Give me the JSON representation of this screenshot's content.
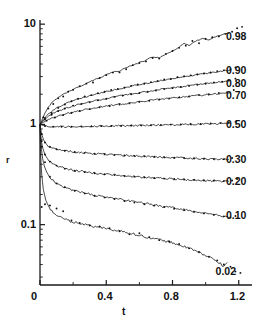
{
  "chart_data": {
    "type": "line",
    "title": "",
    "xlabel": "t",
    "ylabel": "r",
    "xscale": "linear",
    "yscale": "log",
    "xlim": [
      0,
      1.28
    ],
    "ylim": [
      0.025,
      11
    ],
    "xticks": [
      0,
      0.4,
      0.8,
      1.2
    ],
    "xtick_labels": [
      "0",
      "0.4",
      "0.8",
      "1.2"
    ],
    "xminorticks": [
      0.2,
      0.6,
      1.0
    ],
    "yticks": [
      0.1,
      1,
      10
    ],
    "ytick_labels": [
      "0.1",
      "1",
      "10"
    ],
    "grid": false,
    "legend": "inline-right-end-of-curve",
    "marker_style": "dots",
    "line_style": "solid-noisy",
    "series": [
      {
        "name": "0.98",
        "label": "0.98",
        "label_x": 1.215,
        "label_y": 7.6,
        "x": [
          0.0,
          0.01,
          0.02,
          0.03,
          0.05,
          0.07,
          0.09,
          0.11,
          0.13,
          0.15,
          0.18,
          0.21,
          0.24,
          0.27,
          0.3,
          0.33,
          0.36,
          0.39,
          0.42,
          0.45,
          0.48,
          0.51,
          0.54,
          0.57,
          0.6,
          0.63,
          0.66,
          0.69,
          0.72,
          0.75,
          0.78,
          0.81,
          0.84,
          0.87,
          0.9,
          0.93,
          0.96,
          0.99,
          1.02,
          1.05,
          1.08,
          1.11,
          1.14
        ],
        "y": [
          1.0,
          1.09,
          1.19,
          1.3,
          1.48,
          1.63,
          1.75,
          1.86,
          1.95,
          2.04,
          2.16,
          2.28,
          2.4,
          2.53,
          2.66,
          2.8,
          2.92,
          3.06,
          3.22,
          3.36,
          3.42,
          3.62,
          3.8,
          3.95,
          4.12,
          4.3,
          4.55,
          4.72,
          4.6,
          4.95,
          5.2,
          5.55,
          5.9,
          6.45,
          6.1,
          6.6,
          7.0,
          7.2,
          7.0,
          7.45,
          7.7,
          8.0,
          8.1
        ],
        "dots_x": [
          0.02,
          0.05,
          0.08,
          0.11,
          0.14,
          0.17,
          0.2,
          0.24,
          0.28,
          0.32,
          0.36,
          0.4,
          0.44,
          0.48,
          0.52,
          0.56,
          0.6,
          0.64,
          0.68,
          0.72,
          0.76,
          0.8,
          0.84,
          0.88,
          0.92,
          0.96,
          1.0,
          1.04,
          1.08,
          1.12,
          1.16,
          1.19,
          1.22
        ],
        "dots_y": [
          1.18,
          1.44,
          1.6,
          1.82,
          1.9,
          2.12,
          2.22,
          2.4,
          2.55,
          2.62,
          2.9,
          3.1,
          3.3,
          3.3,
          3.55,
          3.9,
          4.1,
          4.25,
          4.6,
          4.55,
          5.05,
          5.4,
          5.8,
          6.1,
          6.8,
          6.45,
          7.1,
          7.4,
          7.55,
          8.0,
          8.4,
          9.1,
          9.4
        ]
      },
      {
        "name": "0.90",
        "label": "0.90",
        "label_x": 1.215,
        "label_y": 3.45,
        "x": [
          0.0,
          0.01,
          0.02,
          0.04,
          0.06,
          0.09,
          0.12,
          0.15,
          0.19,
          0.23,
          0.27,
          0.31,
          0.35,
          0.39,
          0.43,
          0.47,
          0.51,
          0.55,
          0.59,
          0.63,
          0.67,
          0.71,
          0.75,
          0.79,
          0.83,
          0.87,
          0.91,
          0.95,
          0.99,
          1.03,
          1.07,
          1.11,
          1.15
        ],
        "y": [
          1.0,
          1.06,
          1.12,
          1.22,
          1.31,
          1.42,
          1.52,
          1.6,
          1.7,
          1.78,
          1.87,
          1.95,
          2.02,
          2.1,
          2.18,
          2.25,
          2.33,
          2.4,
          2.48,
          2.55,
          2.62,
          2.7,
          2.78,
          2.86,
          2.93,
          3.0,
          3.05,
          3.12,
          3.2,
          3.28,
          3.35,
          3.42,
          3.48
        ],
        "dots_x": [
          0.03,
          0.07,
          0.11,
          0.15,
          0.19,
          0.23,
          0.27,
          0.31,
          0.35,
          0.39,
          0.43,
          0.47,
          0.51,
          0.55,
          0.59,
          0.63,
          0.67,
          0.71,
          0.75,
          0.79,
          0.83,
          0.87,
          0.91,
          0.95,
          0.99,
          1.03,
          1.07,
          1.11,
          1.15,
          1.18
        ],
        "dots_y": [
          1.16,
          1.3,
          1.46,
          1.58,
          1.7,
          1.8,
          1.9,
          1.96,
          2.05,
          2.12,
          2.2,
          2.26,
          2.32,
          2.42,
          2.5,
          2.56,
          2.64,
          2.72,
          2.8,
          2.84,
          2.95,
          3.02,
          3.08,
          3.15,
          3.22,
          3.3,
          3.4,
          3.46,
          3.55,
          3.7
        ]
      },
      {
        "name": "0.80",
        "label": "0.80",
        "label_x": 1.215,
        "label_y": 2.58,
        "x": [
          0.0,
          0.01,
          0.02,
          0.04,
          0.06,
          0.09,
          0.12,
          0.16,
          0.2,
          0.24,
          0.28,
          0.32,
          0.36,
          0.4,
          0.44,
          0.48,
          0.52,
          0.56,
          0.6,
          0.64,
          0.68,
          0.72,
          0.76,
          0.8,
          0.84,
          0.88,
          0.92,
          0.96,
          1.0,
          1.04,
          1.08,
          1.12,
          1.15
        ],
        "y": [
          1.0,
          1.04,
          1.09,
          1.16,
          1.23,
          1.31,
          1.38,
          1.46,
          1.53,
          1.59,
          1.65,
          1.7,
          1.76,
          1.81,
          1.87,
          1.92,
          1.97,
          2.02,
          2.07,
          2.12,
          2.17,
          2.22,
          2.27,
          2.31,
          2.36,
          2.41,
          2.46,
          2.5,
          2.55,
          2.6,
          2.64,
          2.68,
          2.72
        ],
        "dots_x": [
          0.03,
          0.07,
          0.11,
          0.15,
          0.2,
          0.25,
          0.3,
          0.35,
          0.4,
          0.45,
          0.5,
          0.55,
          0.6,
          0.65,
          0.7,
          0.75,
          0.8,
          0.85,
          0.9,
          0.95,
          1.0,
          1.05,
          1.1,
          1.14,
          1.18
        ],
        "dots_y": [
          1.12,
          1.25,
          1.36,
          1.44,
          1.54,
          1.6,
          1.66,
          1.74,
          1.8,
          1.88,
          1.94,
          2.0,
          2.06,
          2.12,
          2.18,
          2.25,
          2.3,
          2.36,
          2.42,
          2.48,
          2.54,
          2.62,
          2.66,
          2.74,
          2.86
        ]
      },
      {
        "name": "0.70",
        "label": "0.70",
        "label_x": 1.215,
        "label_y": 1.96,
        "x": [
          0.0,
          0.01,
          0.03,
          0.05,
          0.08,
          0.12,
          0.16,
          0.2,
          0.25,
          0.3,
          0.35,
          0.4,
          0.45,
          0.5,
          0.55,
          0.6,
          0.65,
          0.7,
          0.75,
          0.8,
          0.85,
          0.9,
          0.95,
          1.0,
          1.05,
          1.1,
          1.15
        ],
        "y": [
          1.0,
          1.03,
          1.07,
          1.11,
          1.16,
          1.22,
          1.28,
          1.33,
          1.38,
          1.43,
          1.48,
          1.52,
          1.56,
          1.6,
          1.64,
          1.68,
          1.72,
          1.76,
          1.8,
          1.84,
          1.87,
          1.91,
          1.94,
          1.98,
          2.01,
          2.05,
          2.08
        ],
        "dots_x": [
          0.04,
          0.09,
          0.14,
          0.19,
          0.24,
          0.3,
          0.36,
          0.42,
          0.48,
          0.54,
          0.6,
          0.66,
          0.72,
          0.78,
          0.84,
          0.9,
          0.96,
          1.02,
          1.08,
          1.13,
          1.17
        ],
        "dots_y": [
          1.09,
          1.17,
          1.24,
          1.3,
          1.36,
          1.42,
          1.48,
          1.52,
          1.58,
          1.62,
          1.68,
          1.72,
          1.77,
          1.82,
          1.86,
          1.9,
          1.96,
          2.0,
          2.06,
          2.1,
          2.2
        ]
      },
      {
        "name": "0.50",
        "label": "0.50",
        "label_x": 1.215,
        "label_y": 1.0,
        "x": [
          0.0,
          0.02,
          0.05,
          0.09,
          0.14,
          0.2,
          0.26,
          0.32,
          0.38,
          0.44,
          0.5,
          0.56,
          0.62,
          0.68,
          0.74,
          0.8,
          0.86,
          0.92,
          0.98,
          1.04,
          1.1,
          1.15
        ],
        "y": [
          1.0,
          0.975,
          0.96,
          0.952,
          0.95,
          0.952,
          0.955,
          0.958,
          0.962,
          0.966,
          0.97,
          0.974,
          0.978,
          0.982,
          0.986,
          0.992,
          0.998,
          1.004,
          1.01,
          1.016,
          1.02,
          1.024
        ],
        "dots_x": [
          0.03,
          0.08,
          0.13,
          0.19,
          0.25,
          0.31,
          0.37,
          0.43,
          0.49,
          0.55,
          0.61,
          0.67,
          0.73,
          0.79,
          0.85,
          0.91,
          0.97,
          1.03,
          1.09,
          1.14,
          1.18
        ],
        "dots_y": [
          0.965,
          0.95,
          0.948,
          0.95,
          0.955,
          0.955,
          0.96,
          0.965,
          0.968,
          0.972,
          0.98,
          0.98,
          0.99,
          0.995,
          1.0,
          1.01,
          1.01,
          1.02,
          1.03,
          1.04,
          1.06
        ]
      },
      {
        "name": "0.30",
        "label": "0.30",
        "label_x": 1.215,
        "label_y": 0.455,
        "x": [
          0.0,
          0.005,
          0.012,
          0.022,
          0.035,
          0.05,
          0.07,
          0.1,
          0.14,
          0.19,
          0.24,
          0.3,
          0.36,
          0.42,
          0.48,
          0.54,
          0.6,
          0.66,
          0.72,
          0.78,
          0.84,
          0.9,
          0.96,
          1.02,
          1.08,
          1.14
        ],
        "y": [
          1.0,
          0.88,
          0.78,
          0.7,
          0.645,
          0.61,
          0.585,
          0.565,
          0.548,
          0.535,
          0.525,
          0.516,
          0.508,
          0.5,
          0.494,
          0.488,
          0.482,
          0.477,
          0.472,
          0.468,
          0.464,
          0.46,
          0.457,
          0.453,
          0.45,
          0.447
        ],
        "dots_x": [
          0.01,
          0.03,
          0.06,
          0.1,
          0.15,
          0.21,
          0.27,
          0.33,
          0.39,
          0.45,
          0.51,
          0.57,
          0.63,
          0.69,
          0.75,
          0.81,
          0.87,
          0.93,
          0.99,
          1.05,
          1.11,
          1.16
        ],
        "dots_y": [
          0.8,
          0.66,
          0.595,
          0.565,
          0.545,
          0.53,
          0.52,
          0.51,
          0.502,
          0.497,
          0.49,
          0.485,
          0.48,
          0.476,
          0.47,
          0.466,
          0.462,
          0.46,
          0.455,
          0.452,
          0.45,
          0.462
        ]
      },
      {
        "name": "0.20",
        "label": "0.20",
        "label_x": 1.215,
        "label_y": 0.275,
        "x": [
          0.0,
          0.004,
          0.01,
          0.018,
          0.03,
          0.045,
          0.065,
          0.09,
          0.13,
          0.18,
          0.24,
          0.3,
          0.36,
          0.42,
          0.48,
          0.54,
          0.6,
          0.66,
          0.72,
          0.78,
          0.84,
          0.9,
          0.96,
          1.02,
          1.08,
          1.14
        ],
        "y": [
          1.0,
          0.8,
          0.66,
          0.57,
          0.5,
          0.455,
          0.42,
          0.395,
          0.372,
          0.355,
          0.342,
          0.332,
          0.323,
          0.316,
          0.31,
          0.304,
          0.299,
          0.294,
          0.29,
          0.286,
          0.283,
          0.28,
          0.277,
          0.274,
          0.272,
          0.27
        ],
        "dots_x": [
          0.01,
          0.03,
          0.06,
          0.1,
          0.15,
          0.21,
          0.27,
          0.33,
          0.39,
          0.45,
          0.51,
          0.57,
          0.63,
          0.69,
          0.75,
          0.81,
          0.87,
          0.93,
          0.99,
          1.05,
          1.11,
          1.16,
          1.19
        ],
        "dots_y": [
          0.68,
          0.5,
          0.425,
          0.388,
          0.362,
          0.345,
          0.334,
          0.326,
          0.318,
          0.312,
          0.306,
          0.301,
          0.296,
          0.292,
          0.288,
          0.285,
          0.282,
          0.279,
          0.276,
          0.274,
          0.272,
          0.276,
          0.285
        ]
      },
      {
        "name": "0.10",
        "label": "0.10",
        "label_x": 1.215,
        "label_y": 0.125,
        "x": [
          0.0,
          0.004,
          0.009,
          0.016,
          0.026,
          0.04,
          0.058,
          0.08,
          0.11,
          0.15,
          0.2,
          0.26,
          0.32,
          0.38,
          0.44,
          0.5,
          0.56,
          0.62,
          0.68,
          0.74,
          0.8,
          0.86,
          0.92,
          0.98,
          1.04,
          1.1,
          1.14
        ],
        "y": [
          1.0,
          0.72,
          0.56,
          0.455,
          0.385,
          0.335,
          0.3,
          0.274,
          0.252,
          0.234,
          0.22,
          0.208,
          0.198,
          0.19,
          0.183,
          0.176,
          0.17,
          0.164,
          0.158,
          0.152,
          0.147,
          0.142,
          0.137,
          0.132,
          0.127,
          0.122,
          0.118
        ],
        "dots_x": [
          0.01,
          0.03,
          0.06,
          0.1,
          0.15,
          0.21,
          0.27,
          0.33,
          0.39,
          0.45,
          0.51,
          0.57,
          0.63,
          0.69,
          0.75,
          0.81,
          0.87,
          0.93,
          0.99,
          1.05,
          1.11,
          1.15,
          1.18
        ],
        "dots_y": [
          0.6,
          0.42,
          0.3,
          0.258,
          0.236,
          0.218,
          0.205,
          0.194,
          0.187,
          0.18,
          0.172,
          0.166,
          0.16,
          0.155,
          0.15,
          0.144,
          0.139,
          0.134,
          0.13,
          0.126,
          0.121,
          0.118,
          0.122
        ]
      },
      {
        "name": "0.02",
        "label": "0.02",
        "label_x": 1.06,
        "label_y": 0.0345,
        "x": [
          0.0,
          0.004,
          0.01,
          0.02,
          0.035,
          0.055,
          0.08,
          0.11,
          0.15,
          0.2,
          0.25,
          0.3,
          0.35,
          0.4,
          0.45,
          0.5,
          0.55,
          0.6,
          0.65,
          0.7,
          0.75,
          0.8,
          0.85,
          0.9,
          0.95,
          1.0,
          1.04,
          1.08,
          1.11,
          1.13
        ],
        "y": [
          1.0,
          0.5,
          0.32,
          0.225,
          0.175,
          0.148,
          0.132,
          0.122,
          0.113,
          0.106,
          0.103,
          0.098,
          0.094,
          0.092,
          0.088,
          0.085,
          0.082,
          0.078,
          0.075,
          0.072,
          0.069,
          0.066,
          0.062,
          0.058,
          0.054,
          0.049,
          0.046,
          0.042,
          0.038,
          0.042
        ],
        "dots_x": [
          0.01,
          0.03,
          0.06,
          0.1,
          0.14,
          0.19,
          0.24,
          0.3,
          0.36,
          0.42,
          0.48,
          0.54,
          0.6,
          0.66,
          0.72,
          0.78,
          0.84,
          0.9,
          0.96,
          1.02,
          1.07,
          1.11,
          1.15,
          1.18,
          1.21
        ],
        "dots_y": [
          0.15,
          0.16,
          0.155,
          0.145,
          0.136,
          0.11,
          0.104,
          0.098,
          0.096,
          0.092,
          0.086,
          0.08,
          0.082,
          0.075,
          0.07,
          0.068,
          0.064,
          0.058,
          0.053,
          0.048,
          0.044,
          0.04,
          0.038,
          0.034,
          0.033
        ]
      }
    ]
  }
}
